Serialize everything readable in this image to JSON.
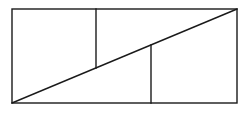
{
  "diagram": {
    "type": "geometric-figure",
    "stroke_color": "#1a1a1a",
    "background_color": "#ffffff",
    "stroke_width": 1.4,
    "rectangle": {
      "x": 12,
      "y": 9,
      "width": 225,
      "height": 94
    },
    "diagonal": {
      "x1": 12,
      "y1": 103,
      "x2": 237,
      "y2": 9
    },
    "segments": [
      {
        "name": "upper-vertical",
        "x1": 96,
        "y1": 9,
        "x2": 96,
        "y2": 68
      },
      {
        "name": "lower-vertical",
        "x1": 151,
        "y1": 45,
        "x2": 151,
        "y2": 103
      }
    ]
  }
}
